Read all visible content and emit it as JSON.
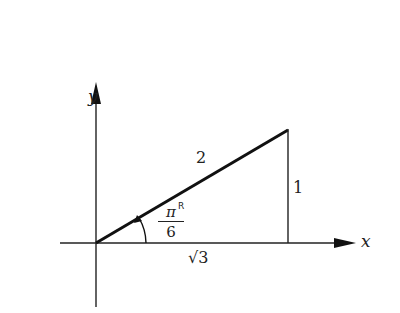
{
  "diagram": {
    "type": "right-triangle-on-axes",
    "axes": {
      "x_label": "x",
      "y_label": "y"
    },
    "triangle": {
      "hypotenuse_label": "2",
      "opposite_label": "1",
      "adjacent_label": "√3",
      "angle_label_numerator": "π",
      "angle_label_superscript": "R",
      "angle_label_denominator": "6"
    },
    "colors": {
      "line": "#111111",
      "background": "#ffffff"
    }
  }
}
